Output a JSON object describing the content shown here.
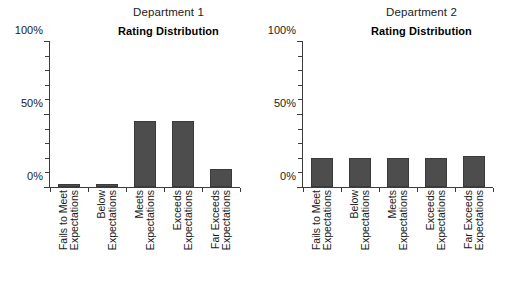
{
  "figure": {
    "background_color": "#ffffff",
    "bar_color": "#4d4d4d",
    "axis_color": "#3c3c3c",
    "text_color": "#1a1a1a"
  },
  "panels": [
    {
      "dept_title": "Department 1",
      "chart_title": "Rating Distribution"
    },
    {
      "dept_title": "Department 2",
      "chart_title": "Rating Distribution"
    }
  ],
  "axis": {
    "y_tick_labels": [
      "0%",
      "50%",
      "100%"
    ],
    "y_label_0": "0%",
    "y_label_50": "50%",
    "y_label_100": "100%"
  },
  "categories": [
    {
      "line1": "Fails to Meet",
      "line2": "Expectations"
    },
    {
      "line1": "Below",
      "line2": "Expectations"
    },
    {
      "line1": "Meets",
      "line2": "Expectations"
    },
    {
      "line1": "Exceeds",
      "line2": "Expectations"
    },
    {
      "line1": "Far Exceeds",
      "line2": "Expectations"
    }
  ],
  "chart_data": {
    "type": "bar",
    "title": "Rating Distribution",
    "xlabel": "",
    "ylabel": "",
    "ylim": [
      0,
      100
    ],
    "ytick_values": [
      0,
      10,
      20,
      30,
      40,
      50,
      60,
      70,
      80,
      90,
      100
    ],
    "ylabeled_ticks": [
      0,
      50,
      100
    ],
    "grid": false,
    "legend": "none",
    "units": "percent",
    "categories": [
      "Fails to Meet Expectations",
      "Below Expectations",
      "Meets Expectations",
      "Exceeds Expectations",
      "Far Exceeds Expectations"
    ],
    "panels": [
      {
        "panel_title": "Department 1",
        "subtitle": "Rating Distribution",
        "values": [
          2,
          2,
          45,
          45,
          12
        ]
      },
      {
        "panel_title": "Department 2",
        "subtitle": "Rating Distribution",
        "values": [
          20,
          20,
          20,
          20,
          21
        ]
      }
    ]
  }
}
